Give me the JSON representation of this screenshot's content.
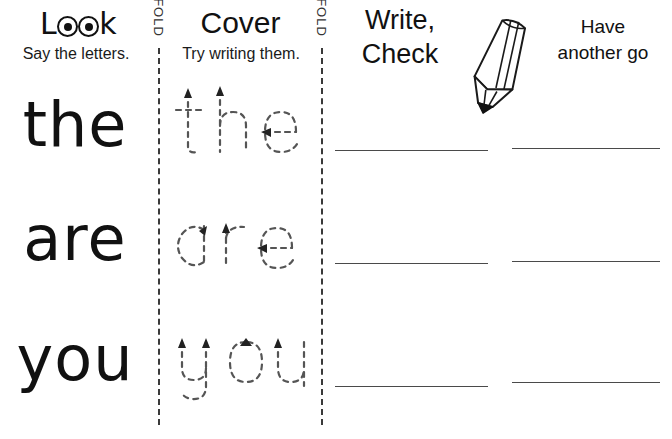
{
  "worksheet": {
    "type": "look-cover-write-check",
    "columns": [
      {
        "id": "look",
        "title": "Look",
        "subtitle": "Say the letters."
      },
      {
        "id": "cover",
        "title": "Cover",
        "subtitle": "Try writing them."
      },
      {
        "id": "write",
        "title_line1": "Write,",
        "title_line2": "Check"
      },
      {
        "id": "again",
        "title_line1": "Have",
        "title_line2": "another go"
      }
    ],
    "fold_label": "FOLD",
    "folds": [
      {
        "label": "FOLD"
      },
      {
        "label": "FOLD"
      }
    ],
    "words": [
      {
        "text": "the",
        "traced": "the"
      },
      {
        "text": "are",
        "traced": "are"
      },
      {
        "text": "you",
        "traced": "you"
      }
    ],
    "icons": {
      "pencil": "pencil-icon",
      "eye_left": "eye-icon",
      "eye_right": "eye-icon"
    },
    "colors": {
      "ink": "#111111",
      "trace": "#555555",
      "rule_line": "#4a4a4a",
      "fold_line": "#3a3a3a",
      "paper": "#ffffff"
    },
    "rows": [
      {
        "line_col3": "",
        "line_col4": ""
      },
      {
        "line_col3": "",
        "line_col4": ""
      },
      {
        "line_col3": "",
        "line_col4": ""
      }
    ]
  }
}
